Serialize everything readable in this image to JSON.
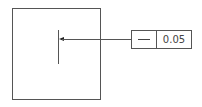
{
  "diagram": {
    "type": "gdt-straightness-callout",
    "feature_control_frame": {
      "symbol": "straightness-icon",
      "tolerance": "0.05"
    },
    "colors": {
      "line": "#555555",
      "text": "#444444",
      "background": "#ffffff"
    }
  }
}
